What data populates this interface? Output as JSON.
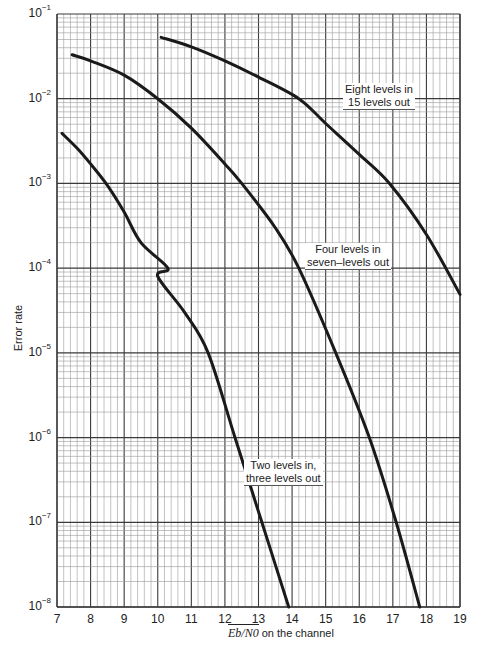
{
  "chart_data": {
    "type": "line",
    "title": "",
    "xlabel": "E_b/N_0 on the channel",
    "xlabel_parts": {
      "symbol": "Eb/N0",
      "rest": "on the channel"
    },
    "ylabel": "Error rate",
    "yscale": "log",
    "xlim": [
      7,
      19
    ],
    "ylim": [
      1e-08,
      0.1
    ],
    "grid": true,
    "x_ticks": [
      "7",
      "8",
      "9",
      "10",
      "11",
      "12",
      "13",
      "14",
      "15",
      "16",
      "17",
      "18",
      "19"
    ],
    "y_ticks": [
      {
        "base": "10",
        "exp": "−1"
      },
      {
        "base": "10",
        "exp": "−2"
      },
      {
        "base": "10",
        "exp": "−3"
      },
      {
        "base": "10",
        "exp": "−4"
      },
      {
        "base": "10",
        "exp": "−5"
      },
      {
        "base": "10",
        "exp": "−6"
      },
      {
        "base": "10",
        "exp": "−7"
      },
      {
        "base": "10",
        "exp": "−8"
      }
    ],
    "series": [
      {
        "name": "Two levels in, three levels out",
        "label_lines": [
          "Two levels in,",
          "three levels out"
        ],
        "x": [
          7.15,
          7.6,
          8.0,
          8.5,
          9.0,
          9.5,
          10.0,
          10.3,
          10.8,
          11.5,
          12.3,
          13.1,
          13.9
        ],
        "y": [
          0.0039,
          0.0026,
          0.0017,
          0.00095,
          0.00046,
          0.0002,
          8e-05,
          0.0001,
          3e-05,
          1e-05,
          1e-06,
          1e-07,
          1e-08
        ]
      },
      {
        "name": "Four levels in, seven-levels out",
        "label_lines": [
          "Four levels in",
          "seven–levels out"
        ],
        "x": [
          7.45,
          8.0,
          9.0,
          10.0,
          11.0,
          12.0,
          12.5,
          13.5,
          14.2,
          15.3,
          16.3,
          17.1,
          17.8
        ],
        "y": [
          0.033,
          0.028,
          0.019,
          0.01,
          0.0045,
          0.0017,
          0.001,
          0.0003,
          0.0001,
          1e-05,
          1e-06,
          1e-07,
          1e-08
        ]
      },
      {
        "name": "Eight levels in 15 levels out",
        "label_lines": [
          "Eight levels in",
          "15 levels out"
        ],
        "x": [
          10.1,
          11.0,
          12.0,
          13.0,
          14.2,
          15.0,
          16.0,
          16.9,
          18.0,
          19.0
        ],
        "y": [
          0.053,
          0.041,
          0.028,
          0.018,
          0.01,
          0.0051,
          0.0022,
          0.001,
          0.00025,
          4.9e-05
        ]
      }
    ],
    "label_positions": [
      {
        "left": 244,
        "top": 459
      },
      {
        "left": 305,
        "top": 243
      },
      {
        "left": 343,
        "top": 83
      }
    ]
  },
  "layout": {
    "plot": {
      "x0": 57,
      "x1": 460,
      "y_top": 14,
      "y_bottom": 607
    },
    "line_color": "#1a1a1a",
    "grid_major_color": "#3a3a3a",
    "grid_minor_color": "#9a9a9a"
  }
}
